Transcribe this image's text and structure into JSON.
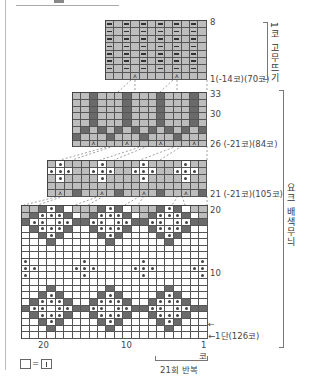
{
  "header": {
    "title_partial": "—  ■  —  ※※※"
  },
  "section_labels": {
    "ribbing": "1코 고무뜨기",
    "yoke_colorwork": "요크 배색무늬"
  },
  "chart_top": {
    "cols": 12,
    "rows": 8,
    "row_top_label": "8",
    "row_bottom_label": "1(-14코)(70코)"
  },
  "chart_mid": {
    "cols": 16,
    "rows": 8,
    "row_labels": [
      "33",
      "30"
    ],
    "row_bottom_label": "26 (-21코)(84코)"
  },
  "chart_third": {
    "cols": 19,
    "rows": 5,
    "row_bottom_label": "21 (-21코)(105코)"
  },
  "chart_bottom": {
    "cols": 22,
    "rows": 20,
    "row_labels": [
      "20",
      "10"
    ],
    "row_bottom_label": "←1단(126코)",
    "arrow_label": "←"
  },
  "x_axis": {
    "ticks": [
      "20",
      "10",
      "1"
    ],
    "unit": "코"
  },
  "repeat_label": "21회 반복",
  "legend": {
    "symbol_left": "□",
    "equals": "=",
    "symbol_right": "⊡"
  },
  "colors": {
    "main_gray": "#bdbdbd",
    "contrast_dark": "#6a6a6a",
    "background_white": "#ffffff",
    "grid_line": "#555555"
  }
}
